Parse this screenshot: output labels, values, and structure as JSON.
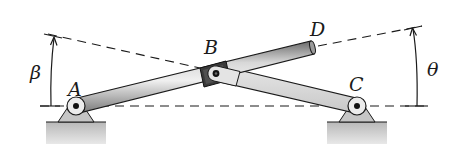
{
  "figure": {
    "labels": {
      "A": "A",
      "B": "B",
      "C": "C",
      "D": "D",
      "beta": "β",
      "theta": "θ"
    },
    "points": {
      "A": [
        76,
        106
      ],
      "B": [
        215,
        73
      ],
      "C": [
        357,
        106
      ],
      "D": [
        312,
        47
      ]
    },
    "angles": {
      "beta": "angle of line AB (extended) measured at A from horizontal",
      "theta": "angle of rod AD measured from horizontal, shown at right"
    },
    "colors": {
      "line": "#1a1a1a",
      "rod_light": "#e0e0e0",
      "rod_mid": "#a8a8a8",
      "rod_dark": "#5a5a5a",
      "collar": "#3a3a3a",
      "ground": "#c4c4c4",
      "support": "#bdbdbd"
    }
  }
}
